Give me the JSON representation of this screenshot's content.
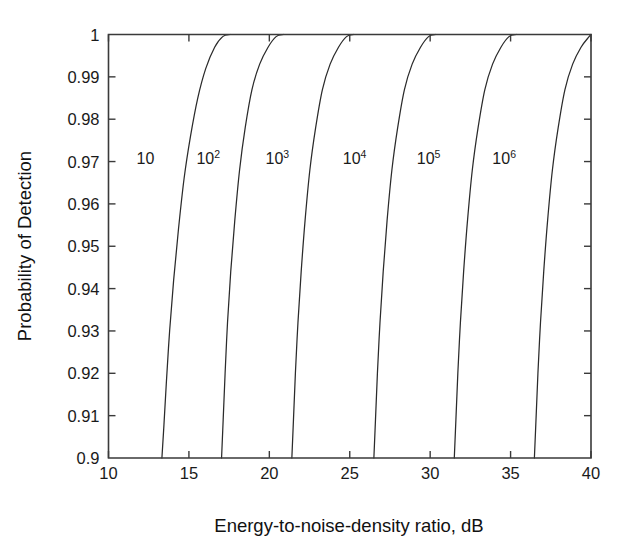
{
  "chart_data": {
    "type": "line",
    "title": "",
    "xlabel": "Energy-to-noise-density ratio, dB",
    "ylabel": "Probability of Detection",
    "xlim": [
      10,
      40
    ],
    "ylim": [
      0.9,
      1
    ],
    "grid": false,
    "legend_position": "inline-curve-labels",
    "xticks": [
      10,
      15,
      20,
      25,
      30,
      35,
      40
    ],
    "xtick_labels": [
      "10",
      "15",
      "20",
      "25",
      "30",
      "35",
      "40"
    ],
    "yticks": [
      0.9,
      0.91,
      0.92,
      0.93,
      0.94,
      0.95,
      0.96,
      0.97,
      0.98,
      0.99,
      1
    ],
    "ytick_labels": [
      "0.9",
      "0.91",
      "0.92",
      "0.93",
      "0.94",
      "0.95",
      "0.96",
      "0.97",
      "0.98",
      "0.99",
      "1"
    ],
    "series": [
      {
        "name": "10",
        "label_base": "10",
        "label_exponent": "",
        "label_x": 12.3,
        "label_y": 0.9695,
        "x": [
          13.32,
          13.45,
          13.6,
          13.8,
          14.05,
          14.35,
          14.7,
          15.1,
          15.55,
          16.05,
          16.6,
          17.1,
          17.55
        ],
        "y": [
          0.9,
          0.908,
          0.918,
          0.93,
          0.942,
          0.954,
          0.966,
          0.976,
          0.985,
          0.992,
          0.997,
          0.9995,
          1.0
        ]
      },
      {
        "name": "10^2",
        "label_base": "10",
        "label_exponent": "2",
        "label_x": 16.2,
        "label_y": 0.9695,
        "x": [
          17.03,
          17.13,
          17.25,
          17.4,
          17.6,
          17.85,
          18.15,
          18.5,
          18.92,
          19.4,
          19.92,
          20.42,
          20.88
        ],
        "y": [
          0.9,
          0.909,
          0.92,
          0.932,
          0.944,
          0.956,
          0.968,
          0.978,
          0.987,
          0.993,
          0.997,
          0.9995,
          1.0
        ]
      },
      {
        "name": "10^3",
        "label_base": "10",
        "label_exponent": "3",
        "label_x": 20.5,
        "label_y": 0.9695,
        "x": [
          21.4,
          21.5,
          21.62,
          21.78,
          21.98,
          22.22,
          22.52,
          22.88,
          23.3,
          23.78,
          24.3,
          24.8,
          25.25
        ],
        "y": [
          0.9,
          0.909,
          0.92,
          0.932,
          0.944,
          0.956,
          0.968,
          0.978,
          0.987,
          0.993,
          0.997,
          0.9995,
          1.0
        ]
      },
      {
        "name": "10^4",
        "label_base": "10",
        "label_exponent": "4",
        "label_x": 25.3,
        "label_y": 0.9695,
        "x": [
          26.5,
          26.6,
          26.72,
          26.88,
          27.08,
          27.32,
          27.62,
          27.98,
          28.4,
          28.88,
          29.4,
          29.9,
          30.35
        ],
        "y": [
          0.9,
          0.909,
          0.92,
          0.932,
          0.944,
          0.956,
          0.968,
          0.978,
          0.987,
          0.993,
          0.997,
          0.9995,
          1.0
        ]
      },
      {
        "name": "10^5",
        "label_base": "10",
        "label_exponent": "5",
        "label_x": 29.9,
        "label_y": 0.9695,
        "x": [
          31.5,
          31.6,
          31.72,
          31.88,
          32.08,
          32.32,
          32.62,
          32.98,
          33.4,
          33.88,
          34.4,
          34.9,
          35.35
        ],
        "y": [
          0.9,
          0.909,
          0.92,
          0.932,
          0.944,
          0.956,
          0.968,
          0.978,
          0.987,
          0.993,
          0.997,
          0.9995,
          1.0
        ]
      },
      {
        "name": "10^6",
        "label_base": "10",
        "label_exponent": "6",
        "label_x": 34.6,
        "label_y": 0.9695,
        "x": [
          36.48,
          36.58,
          36.7,
          36.86,
          37.06,
          37.3,
          37.6,
          37.96,
          38.38,
          38.86,
          39.38,
          39.88,
          40.0
        ],
        "y": [
          0.9,
          0.909,
          0.92,
          0.932,
          0.944,
          0.956,
          0.968,
          0.978,
          0.987,
          0.993,
          0.997,
          0.9995,
          1.0
        ]
      }
    ]
  },
  "colors": {
    "curve": "#2b2b2b",
    "axis": "#3a3a3a",
    "text": "#1a1a1a",
    "background": "#ffffff"
  }
}
